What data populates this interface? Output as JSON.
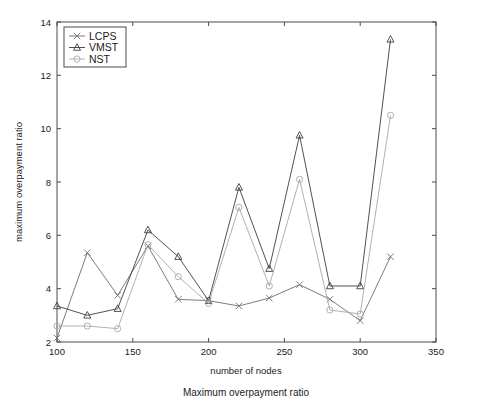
{
  "figure": {
    "caption": "Maximum overpayment ratio"
  },
  "chart_data": {
    "type": "line",
    "title": "",
    "xlabel": "number of nodes",
    "ylabel": "maximum overpayment ratio",
    "x": [
      100,
      120,
      140,
      160,
      180,
      200,
      220,
      240,
      260,
      280,
      300,
      320
    ],
    "xlim": [
      100,
      350
    ],
    "ylim": [
      2,
      14
    ],
    "xticks": [
      100,
      150,
      200,
      250,
      300,
      350
    ],
    "xticklabels": [
      "100",
      "150",
      "200",
      "250",
      "300",
      "350"
    ],
    "yticks": [
      2,
      4,
      6,
      8,
      10,
      12,
      14
    ],
    "yticklabels": [
      "2",
      "4",
      "6",
      "8",
      "10",
      "12",
      "14"
    ],
    "grid": false,
    "legend_position": "upper left",
    "series": [
      {
        "name": "LCPS",
        "marker": "x",
        "color": "#6e6e6e",
        "values": [
          2.15,
          5.35,
          3.75,
          5.6,
          3.6,
          3.55,
          3.35,
          3.65,
          4.15,
          3.6,
          2.8,
          5.2
        ]
      },
      {
        "name": "VMST",
        "marker": "triangle",
        "color": "#3d3d3d",
        "values": [
          3.35,
          3.0,
          3.25,
          6.2,
          5.2,
          3.55,
          7.8,
          4.75,
          9.75,
          4.1,
          4.1,
          13.35
        ]
      },
      {
        "name": "NST",
        "marker": "circle",
        "color": "#a8a8a8",
        "values": [
          2.6,
          2.6,
          2.5,
          5.65,
          4.45,
          3.45,
          7.05,
          4.1,
          8.1,
          3.2,
          3.05,
          10.5
        ]
      }
    ]
  }
}
